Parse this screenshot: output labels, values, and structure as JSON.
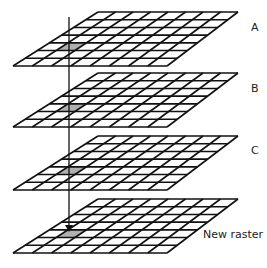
{
  "diagram": {
    "title_partial": "",
    "grid": {
      "columns": 8,
      "rows": 7,
      "highlight_row": 4,
      "highlight_col": 1
    },
    "colors": {
      "line": "#111111",
      "highlight": "#b0b0b0",
      "background": "#ffffff"
    },
    "layers": [
      {
        "label": "A",
        "top": 12,
        "label_x": 251,
        "label_y": 21
      },
      {
        "label": "B",
        "top": 73,
        "label_x": 251,
        "label_y": 82
      },
      {
        "label": "C",
        "top": 136,
        "label_x": 251,
        "label_y": 144
      },
      {
        "label": "New raster",
        "top": 199,
        "label_x": 203,
        "label_y": 228
      }
    ],
    "arrow": {
      "x": 69,
      "y_start": 17,
      "y_end": 232,
      "direction": "down"
    }
  }
}
